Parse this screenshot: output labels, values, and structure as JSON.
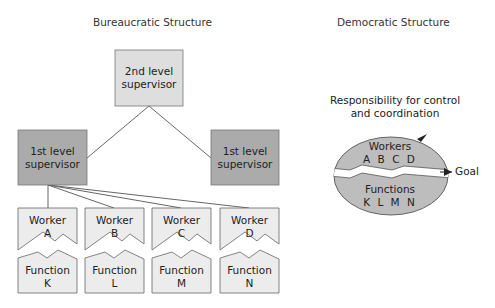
{
  "bureaucratic": {
    "title": "Bureaucratic Structure",
    "second_level": {
      "line1": "2nd level",
      "line2": "supervisor"
    },
    "first_level_left": {
      "line1": "1st level",
      "line2": "supervisor"
    },
    "first_level_right": {
      "line1": "1st level",
      "line2": "supervisor"
    },
    "workers": [
      {
        "line1": "Worker",
        "line2": "A"
      },
      {
        "line1": "Worker",
        "line2": "B"
      },
      {
        "line1": "Worker",
        "line2": "C"
      },
      {
        "line1": "Worker",
        "line2": "D"
      }
    ],
    "functions": [
      {
        "line1": "Function",
        "line2": "K"
      },
      {
        "line1": "Function",
        "line2": "L"
      },
      {
        "line1": "Function",
        "line2": "M"
      },
      {
        "line1": "Function",
        "line2": "N"
      }
    ]
  },
  "democratic": {
    "title": "Democratic Structure",
    "responsibility": {
      "line1": "Responsibility for control",
      "line2": "and coordination"
    },
    "workers": {
      "line1": "Workers",
      "line2": "A B C D"
    },
    "functions": {
      "line1": "Functions",
      "line2": "K L M N"
    },
    "goal_label": "Goal"
  },
  "colors": {
    "second_level_fill": "#dedede",
    "first_level_fill": "#ababab",
    "box_fill": "#ececec",
    "ellipse_fill": "#bdbdbd",
    "stroke": "#555555"
  }
}
